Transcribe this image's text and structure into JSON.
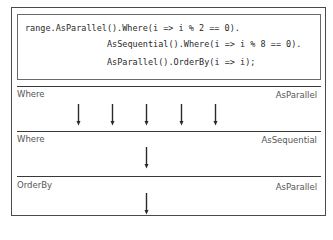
{
  "code": {
    "lines": [
      "range.AsParallel().Where(i => i % 2 == 0).",
      "AsSequential().Where(i => i % 8 == 0).",
      "AsParallel().OrderBy(i => i);"
    ]
  },
  "stages": [
    {
      "operator": "Where",
      "mode": "AsParallel",
      "arrow_count": 5
    },
    {
      "operator": "Where",
      "mode": "AsSequential",
      "arrow_count": 1
    },
    {
      "operator": "OrderBy",
      "mode": "AsParallel",
      "arrow_count": 1
    }
  ],
  "icons": {
    "flow_arrow": "down-arrow"
  },
  "colors": {
    "border": "#4a4a4a",
    "divider": "#3a3a3a",
    "code_text": "#2a2a2a",
    "label_text": "#555555",
    "arrow": "#2a2a2a"
  }
}
